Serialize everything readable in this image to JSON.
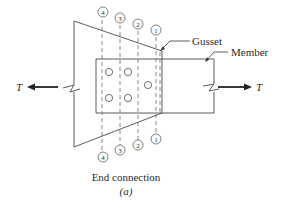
{
  "figure": {
    "caption": "End connection",
    "sublabel": "(a)"
  },
  "labels": {
    "gusset": "Gusset",
    "member": "Member",
    "force_left": "T",
    "force_right": "T"
  },
  "sections": {
    "top": [
      "4",
      "3",
      "2",
      "1"
    ],
    "bottom": [
      "1",
      "2",
      "3",
      "4"
    ]
  },
  "bolts": {
    "count": 5,
    "arrangement": "two columns of two bolts plus one center bolt"
  }
}
